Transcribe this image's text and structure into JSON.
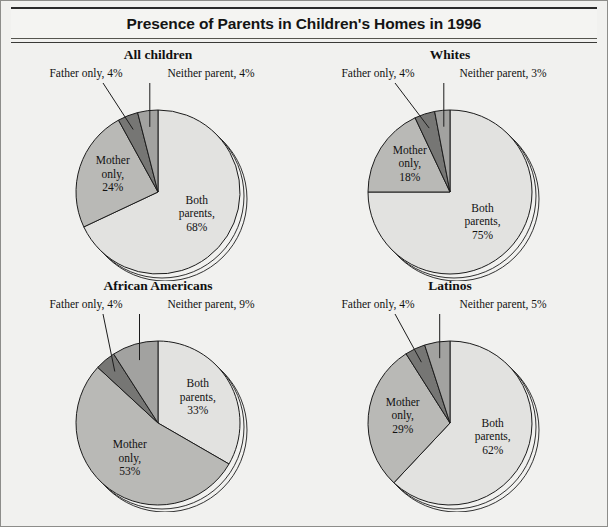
{
  "header": {
    "title": "Presence of Parents in Children's Homes in 1996"
  },
  "chart_data": {
    "type": "pie",
    "title": "Presence of Parents in Children's Homes in 1996",
    "unit": "percent",
    "legend_position": "none",
    "categories": [
      "Both parents",
      "Mother only",
      "Father only",
      "Neither parent"
    ],
    "colors": {
      "both_parents": "#e2e2e0",
      "mother_only": "#b9b9b6",
      "father_only": "#767674",
      "neither_parent": "#a2a2a0",
      "outline": "#1c1c1c",
      "background": "#f1f1ef"
    },
    "panels": [
      {
        "title": "All children",
        "values": [
          68,
          24,
          4,
          4
        ],
        "slices": [
          {
            "name": "Both parents",
            "value": 68,
            "label_lines": [
              "Both",
              "parents,",
              "68%"
            ]
          },
          {
            "name": "Mother only",
            "value": 24,
            "label_lines": [
              "Mother",
              "only,",
              "24%"
            ]
          },
          {
            "name": "Father only",
            "value": 4,
            "callout": "Father only, 4%"
          },
          {
            "name": "Neither parent",
            "value": 4,
            "callout": "Neither parent, 4%"
          }
        ]
      },
      {
        "title": "Whites",
        "values": [
          75,
          18,
          4,
          3
        ],
        "slices": [
          {
            "name": "Both parents",
            "value": 75,
            "label_lines": [
              "Both",
              "parents,",
              "75%"
            ]
          },
          {
            "name": "Mother only",
            "value": 18,
            "label_lines": [
              "Mother",
              "only,",
              "18%"
            ]
          },
          {
            "name": "Father only",
            "value": 4,
            "callout": "Father only, 4%"
          },
          {
            "name": "Neither parent",
            "value": 3,
            "callout": "Neither parent, 3%"
          }
        ]
      },
      {
        "title": "African Americans",
        "values": [
          33,
          53,
          4,
          9
        ],
        "slices": [
          {
            "name": "Both parents",
            "value": 33,
            "label_lines": [
              "Both",
              "parents,",
              "33%"
            ]
          },
          {
            "name": "Mother only",
            "value": 53,
            "label_lines": [
              "Mother",
              "only,",
              "53%"
            ]
          },
          {
            "name": "Father only",
            "value": 4,
            "callout": "Father only, 4%"
          },
          {
            "name": "Neither parent",
            "value": 9,
            "callout": "Neither parent, 9%"
          }
        ]
      },
      {
        "title": "Latinos",
        "values": [
          62,
          29,
          4,
          5
        ],
        "slices": [
          {
            "name": "Both parents",
            "value": 62,
            "label_lines": [
              "Both",
              "parents,",
              "62%"
            ]
          },
          {
            "name": "Mother only",
            "value": 29,
            "label_lines": [
              "Mother",
              "only,",
              "29%"
            ]
          },
          {
            "name": "Father only",
            "value": 4,
            "callout": "Father only, 4%"
          },
          {
            "name": "Neither parent",
            "value": 5,
            "callout": "Neither parent, 5%"
          }
        ]
      }
    ]
  }
}
